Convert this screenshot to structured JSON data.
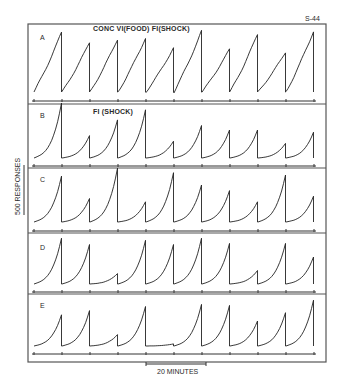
{
  "figure": {
    "id_label": "S-44",
    "y_scale_label": "500 RESPONSES",
    "x_scale_label": "20 MINUTES"
  },
  "chart_data": {
    "type": "line",
    "xlabel": "Time (scale bar: 20 MINUTES)",
    "ylabel": "Cumulative responses (scale bar: 500 RESPONSES)",
    "grid": false,
    "legend": "none",
    "note": "Cumulative records; pen resets at the end of each fixed-interval segment. Values are peak heights in approximate responses (0-500) per interval, 10 intervals per panel.",
    "panels": [
      {
        "label": "A",
        "condition": "CONC VI(FOOD) FI(SHOCK)",
        "intervals": 10,
        "peaks": [
          480,
          400,
          425,
          435,
          355,
          490,
          345,
          465,
          320,
          490
        ],
        "shape": "linear"
      },
      {
        "label": "B",
        "condition": "FI (SHOCK)",
        "intervals": 10,
        "peaks": [
          490,
          200,
          340,
          430,
          150,
          290,
          250,
          250,
          130,
          230
        ],
        "shape": "scallop"
      },
      {
        "label": "C",
        "condition": "",
        "intervals": 10,
        "peaks": [
          410,
          210,
          480,
          180,
          440,
          330,
          280,
          180,
          420,
          230
        ],
        "shape": "scallop"
      },
      {
        "label": "D",
        "condition": "",
        "intervals": 10,
        "peaks": [
          440,
          380,
          100,
          420,
          380,
          440,
          390,
          130,
          390,
          260
        ],
        "shape": "scallop"
      },
      {
        "label": "E",
        "condition": "",
        "intervals": 10,
        "peaks": [
          300,
          340,
          110,
          380,
          20,
          400,
          390,
          240,
          320,
          440
        ],
        "shape": "scallop"
      }
    ]
  },
  "render": {
    "frame": {
      "x": 28,
      "y": 24,
      "w": 298,
      "h": 338
    },
    "x_start": 34,
    "x_step": 28,
    "panels_geom": [
      {
        "top": 24,
        "base": 92,
        "axis": 101,
        "sep": 104,
        "pxPer500": 62,
        "label_xy": [
          40,
          40
        ],
        "cond_xy": [
          93,
          31
        ]
      },
      {
        "top": 104,
        "base": 158,
        "axis": 166,
        "sep": 168,
        "pxPer500": 56,
        "label_xy": [
          40,
          118
        ],
        "cond_xy": [
          93,
          114
        ]
      },
      {
        "top": 168,
        "base": 222,
        "axis": 231,
        "sep": 233,
        "pxPer500": 56,
        "label_xy": [
          40,
          182
        ],
        "cond_xy": [
          93,
          180
        ]
      },
      {
        "top": 233,
        "base": 284,
        "axis": 292,
        "sep": 294,
        "pxPer500": 52,
        "label_xy": [
          40,
          250
        ],
        "cond_xy": [
          93,
          246
        ]
      },
      {
        "top": 294,
        "base": 346,
        "axis": 354,
        "sep": 362,
        "pxPer500": 52,
        "label_xy": [
          40,
          308
        ],
        "cond_xy": [
          93,
          306
        ]
      }
    ],
    "y_scale_bar": {
      "x": 24,
      "y1": 165,
      "y2": 215
    },
    "x_scale_bar": {
      "x1": 146,
      "x2": 206,
      "y": 364
    }
  }
}
